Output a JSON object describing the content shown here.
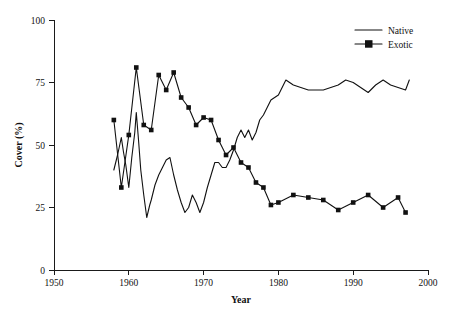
{
  "chart_data": {
    "type": "line",
    "title": "",
    "xlabel": "Year",
    "ylabel": "Cover (%)",
    "xlim": [
      1950,
      2000
    ],
    "ylim": [
      0,
      100
    ],
    "xticks": [
      1950,
      1960,
      1970,
      1980,
      1990,
      2000
    ],
    "yticks": [
      0,
      25,
      50,
      75,
      100
    ],
    "xtick_labels": [
      "1950",
      "1960",
      "1970",
      "1980",
      "1990",
      "2000"
    ],
    "ytick_labels": [
      "0",
      "25",
      "50",
      "75",
      "100"
    ],
    "grid": false,
    "legend_position": "top-right",
    "legend": [
      {
        "name": "Native",
        "marker": "none",
        "line": "solid",
        "color": "#111111"
      },
      {
        "name": "Exotic",
        "marker": "square",
        "line": "solid",
        "color": "#111111"
      }
    ],
    "series": [
      {
        "name": "Native",
        "marker": "none",
        "color": "#111111",
        "x": [
          1958,
          1958.5,
          1959,
          1959.3,
          1959.6,
          1960,
          1960.4,
          1960.8,
          1961,
          1961.3,
          1961.6,
          1962,
          1962.4,
          1962.8,
          1963,
          1963.5,
          1964,
          1964.5,
          1965,
          1965.5,
          1966,
          1966.5,
          1967,
          1967.5,
          1968,
          1968.5,
          1969,
          1969.5,
          1970,
          1970.5,
          1971,
          1971.5,
          1972,
          1972.5,
          1973,
          1973.5,
          1974,
          1974.5,
          1975,
          1975.5,
          1976,
          1976.5,
          1977,
          1977.5,
          1978,
          1978.5,
          1979,
          1980,
          1981,
          1982,
          1983,
          1984,
          1985,
          1986,
          1987,
          1988,
          1989,
          1990,
          1991,
          1992,
          1993,
          1994,
          1995,
          1996,
          1997,
          1997.5
        ],
        "y": [
          40,
          46,
          53,
          47,
          42,
          33,
          45,
          55,
          63,
          52,
          40,
          30,
          21,
          26,
          28,
          34,
          38,
          41,
          44,
          45,
          38,
          32,
          27,
          23,
          25,
          30,
          27,
          23,
          27,
          33,
          38,
          43,
          43,
          41,
          41,
          44,
          48,
          53,
          56,
          53,
          56,
          52,
          55,
          60,
          62,
          65,
          68,
          70,
          76,
          74,
          73,
          72,
          72,
          72,
          73,
          74,
          76,
          75,
          73,
          71,
          74,
          76,
          74,
          73,
          72,
          76
        ]
      },
      {
        "name": "Exotic",
        "marker": "square",
        "color": "#111111",
        "x": [
          1958,
          1959,
          1960,
          1961,
          1962,
          1963,
          1964,
          1965,
          1966,
          1967,
          1968,
          1969,
          1970,
          1971,
          1972,
          1973,
          1974,
          1975,
          1976,
          1977,
          1978,
          1979,
          1980,
          1982,
          1984,
          1986,
          1988,
          1990,
          1992,
          1994,
          1996,
          1997
        ],
        "y": [
          60,
          33,
          54,
          81,
          58,
          56,
          78,
          72,
          79,
          69,
          65,
          58,
          61,
          60,
          52,
          46,
          49,
          43,
          41,
          35,
          33,
          26,
          27,
          30,
          29,
          28,
          24,
          27,
          30,
          25,
          29,
          23
        ]
      }
    ]
  },
  "axes": {
    "x_title": "Year",
    "y_title": "Cover (%)"
  },
  "legend": {
    "native_label": "Native",
    "exotic_label": "Exotic"
  }
}
